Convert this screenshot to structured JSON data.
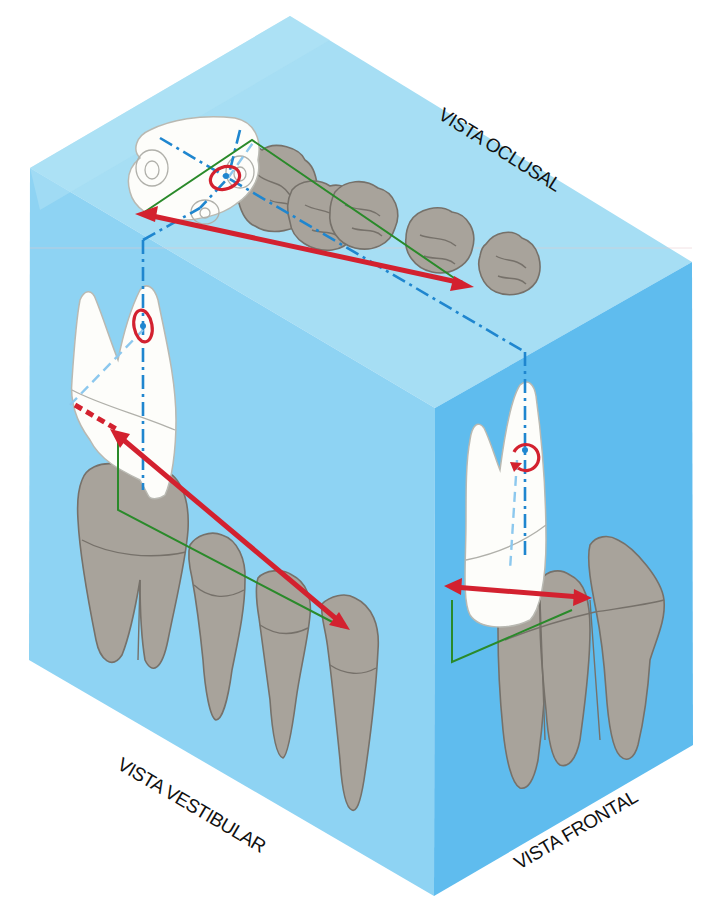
{
  "figure": {
    "type": "isometric dental projection cube",
    "labels": {
      "top": "VISTA OCLUSAL",
      "left": "VISTA VESTIBULAR",
      "right": "VISTA FRONTAL"
    },
    "colors": {
      "top_face": "#a6def4",
      "left_face": "#8ed3f3",
      "right_face": "#5fbcee",
      "tooth_neighbor": "#a8a39b",
      "tooth_subject": "#fdfdfa",
      "axis_line": "#1f86cf",
      "moment_arrow": "#d3212f",
      "lever_arm": "#2a8a2a"
    },
    "elements": {
      "projection_axis": "dash-dot blue line connecting views",
      "force_arrows": "double-headed red arrows in each view",
      "rotation_markers": "red circular arrows around center of resistance",
      "lever_lines": "green right-angle lines"
    }
  }
}
